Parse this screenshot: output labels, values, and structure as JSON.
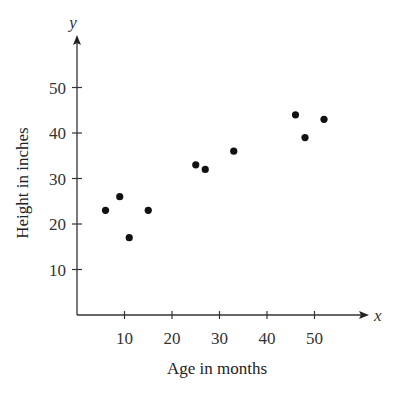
{
  "chart_data": {
    "type": "scatter",
    "title": "",
    "xlabel": "Age in months",
    "ylabel": "Height in inches",
    "x_axis_var": "x",
    "y_axis_var": "y",
    "xlim": [
      0,
      60
    ],
    "ylim": [
      0,
      58
    ],
    "x_ticks": [
      10,
      20,
      30,
      40,
      50
    ],
    "y_ticks": [
      10,
      20,
      30,
      40,
      50
    ],
    "grid": false,
    "legend": null,
    "series": [
      {
        "name": "Children",
        "color": "#111111",
        "points": [
          {
            "x": 6,
            "y": 23
          },
          {
            "x": 9,
            "y": 26
          },
          {
            "x": 11,
            "y": 17
          },
          {
            "x": 15,
            "y": 23
          },
          {
            "x": 25,
            "y": 33
          },
          {
            "x": 27,
            "y": 32
          },
          {
            "x": 33,
            "y": 36
          },
          {
            "x": 46,
            "y": 44
          },
          {
            "x": 48,
            "y": 39
          },
          {
            "x": 52,
            "y": 43
          }
        ]
      }
    ]
  }
}
